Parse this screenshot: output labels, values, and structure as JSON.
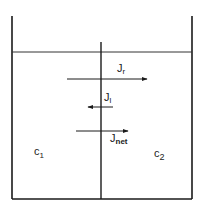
{
  "diagram": {
    "title": "",
    "colors": {
      "line": "#1a1a1a",
      "background": "#ffffff"
    },
    "container": {
      "left_x": 12,
      "right_x": 192,
      "top_y": 16,
      "bottom_y": 199
    },
    "liquid_level_y": 52,
    "membrane": {
      "x": 101,
      "top_y": 42,
      "bottom_y": 199
    },
    "fluxes": [
      {
        "id": "jr",
        "symbol": "J",
        "subscript": "r",
        "direction": "right",
        "x1": 67,
        "x2": 147,
        "y": 79
      },
      {
        "id": "jl",
        "symbol": "J",
        "subscript": "l",
        "direction": "left",
        "x1": 88,
        "x2": 113,
        "y": 107
      },
      {
        "id": "jnet",
        "symbol": "J",
        "subscript": "net",
        "direction": "right",
        "x1": 76,
        "x2": 128,
        "y": 131
      }
    ],
    "compartments": [
      {
        "id": "left",
        "symbol": "c",
        "subscript": "1"
      },
      {
        "id": "right",
        "symbol": "c",
        "subscript": "2"
      }
    ]
  }
}
